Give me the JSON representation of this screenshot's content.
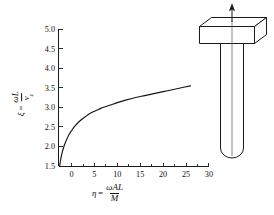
{
  "figure": {
    "kind": "technical-figure"
  },
  "axes": {
    "y_label": {
      "variable": "ξ",
      "equals": "=",
      "numerator": "ωL",
      "denominator": "v",
      "denominator_sub": "ε"
    },
    "x_label": {
      "variable": "η",
      "equals": "=",
      "numerator": "ωAL",
      "denominator": "M"
    },
    "y_ticks": [
      "1.5",
      "2.0",
      "2.5",
      "3.0",
      "3.5",
      "4.0",
      "4.5",
      "5.0"
    ],
    "x_ticks": [
      "0",
      "5",
      "10",
      "15",
      "20",
      "25",
      "30"
    ],
    "x_minor_count": 5,
    "y_min": 1.5,
    "y_max": 5.0,
    "x_min": -3.2,
    "x_max": 32.0
  },
  "chart_data": {
    "type": "line",
    "title": "",
    "xlabel": "η = ωAL / M",
    "ylabel": "ξ = ωL / vε",
    "xlim": [
      -3.2,
      32.0
    ],
    "ylim": [
      1.5,
      5.0
    ],
    "grid": false,
    "legend": "none",
    "series": [
      {
        "name": "ξ(η)",
        "x": [
          -2.6,
          -2.5,
          -2.4,
          -2.2,
          -2.0,
          -1.7,
          -1.4,
          -1.0,
          -0.5,
          0.0,
          0.6,
          1.2,
          2.0,
          3.0,
          4.0,
          5.0,
          6.0,
          7.0,
          8.5,
          10.0,
          12.0,
          14.0,
          16.0,
          18.0,
          20.0,
          22.0,
          24.0,
          26.0
        ],
        "y": [
          1.5,
          1.56,
          1.64,
          1.76,
          1.86,
          1.98,
          2.08,
          2.19,
          2.31,
          2.4,
          2.5,
          2.58,
          2.67,
          2.76,
          2.84,
          2.9,
          2.95,
          3.0,
          3.06,
          3.12,
          3.19,
          3.25,
          3.3,
          3.35,
          3.4,
          3.45,
          3.5,
          3.55
        ]
      }
    ]
  },
  "sketch": {
    "name": "rod-with-tip-mass",
    "parts": {
      "block": "rectangular-mass-block",
      "rod": "slender-rod",
      "arrow": "upward-force-arrow",
      "centerline": "axis-centerline"
    }
  }
}
